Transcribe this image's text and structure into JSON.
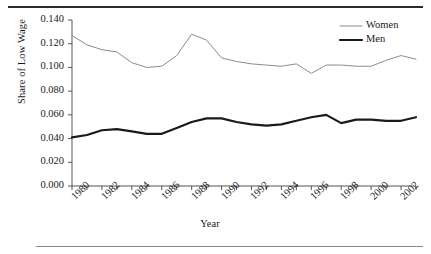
{
  "chart_data": {
    "type": "line",
    "title": "",
    "xlabel": "Year",
    "ylabel": "Share of Low Wage",
    "xlim": [
      1980,
      2003
    ],
    "ylim": [
      0.0,
      0.14
    ],
    "grid": false,
    "legend_position": "top-right",
    "x": [
      1980,
      1981,
      1982,
      1983,
      1984,
      1985,
      1986,
      1987,
      1988,
      1989,
      1990,
      1991,
      1992,
      1993,
      1994,
      1995,
      1996,
      1997,
      1998,
      1999,
      2000,
      2001,
      2002,
      2003
    ],
    "xtick_labels": [
      "1980",
      "1982",
      "1984",
      "1986",
      "1988",
      "1990",
      "1992",
      "1994",
      "1996",
      "1998",
      "2000",
      "2002"
    ],
    "ytick_labels": [
      "0.000",
      "0.020",
      "0.040",
      "0.060",
      "0.080",
      "0.100",
      "0.120",
      "0.140"
    ],
    "ytick_values": [
      0.0,
      0.02,
      0.04,
      0.06,
      0.08,
      0.1,
      0.12,
      0.14
    ],
    "series": [
      {
        "name": "Women",
        "color": "#8c8c8c",
        "width": 1.0,
        "values": [
          0.127,
          0.119,
          0.115,
          0.113,
          0.104,
          0.1,
          0.101,
          0.11,
          0.128,
          0.123,
          0.108,
          0.105,
          0.103,
          0.102,
          0.101,
          0.103,
          0.095,
          0.102,
          0.102,
          0.101,
          0.101,
          0.106,
          0.11,
          0.107
        ]
      },
      {
        "name": "Men",
        "color": "#1a1a1a",
        "width": 2.2,
        "values": [
          0.041,
          0.043,
          0.047,
          0.048,
          0.046,
          0.044,
          0.044,
          0.049,
          0.054,
          0.057,
          0.057,
          0.054,
          0.052,
          0.051,
          0.052,
          0.055,
          0.058,
          0.06,
          0.053,
          0.056,
          0.056,
          0.055,
          0.055,
          0.058
        ]
      }
    ]
  },
  "axis": {
    "ylabel": "Share of Low Wage",
    "xlabel": "Year"
  },
  "legend": {
    "items": [
      {
        "label": "Women",
        "color": "#8c8c8c"
      },
      {
        "label": "Men",
        "color": "#1a1a1a"
      }
    ]
  }
}
